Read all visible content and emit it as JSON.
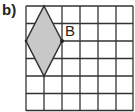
{
  "part_label": "b)",
  "grid": {
    "columns": 6,
    "rows": 6,
    "line_color": "#333333"
  },
  "shape": {
    "type": "rhombus",
    "fill": "#c8c8c8",
    "stroke": "#333333",
    "vertices_grid": [
      [
        1,
        0
      ],
      [
        2,
        2
      ],
      [
        1,
        4
      ],
      [
        0,
        2
      ]
    ]
  },
  "point": {
    "label": "B",
    "grid_position": [
      2,
      2
    ]
  }
}
